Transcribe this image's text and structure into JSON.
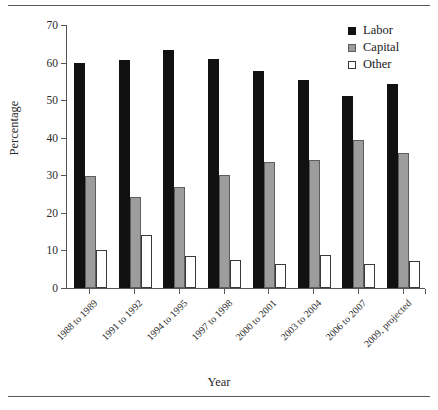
{
  "figure": {
    "background": "#ffffff",
    "rule_color": "#5a5a5a",
    "has_top_rule": true,
    "has_bottom_rule": true
  },
  "chart_data": {
    "type": "bar",
    "title": "",
    "subtitle": "",
    "xlabel": "Year",
    "ylabel": "Percentage",
    "ylim": [
      0,
      70
    ],
    "yticks": [
      0,
      10,
      20,
      30,
      40,
      50,
      60,
      70
    ],
    "ytick_labels": [
      "0",
      "10",
      "20",
      "30",
      "40",
      "50",
      "60",
      "70"
    ],
    "grid": false,
    "legend_position": "top-right",
    "categories": [
      "1988 to 1989",
      "1991 to 1992",
      "1994 to 1995",
      "1997 to 1998",
      "2000 to 2001",
      "2003 to 2004",
      "2006 to 2007",
      "2009, projected"
    ],
    "series": [
      {
        "name": "Labor",
        "color": "#111111",
        "edge_color": "#111111",
        "values": [
          60.0,
          60.8,
          63.3,
          61.0,
          57.8,
          55.4,
          51.1,
          54.3
        ]
      },
      {
        "name": "Capital",
        "color": "#9d9d9d",
        "edge_color": "#5e5e5e",
        "values": [
          29.8,
          24.2,
          27.0,
          30.1,
          33.6,
          34.0,
          39.4,
          35.9
        ]
      },
      {
        "name": "Other",
        "color": "#ffffff",
        "edge_color": "#3a3a3a",
        "values": [
          10.0,
          14.1,
          8.6,
          7.5,
          6.5,
          8.7,
          6.5,
          7.3
        ]
      }
    ]
  }
}
